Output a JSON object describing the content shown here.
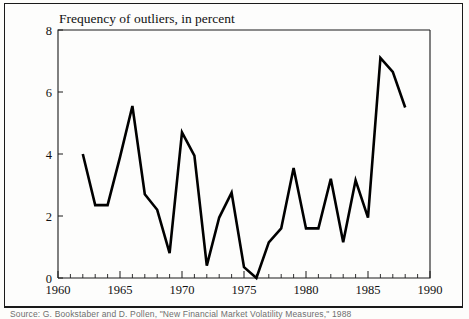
{
  "figure": {
    "title": "Frequency of outliers, in percent",
    "caption": "Source: G. Bookstaber and D. Pollen, \"New Financial Market Volatility Measures,\" 1988"
  },
  "chart_data": {
    "type": "line",
    "title": "Frequency of outliers, in percent",
    "xlabel": "",
    "ylabel": "Frequency of outliers, in percent",
    "xlim": [
      1960,
      1990
    ],
    "ylim": [
      0,
      8
    ],
    "yticks": [
      0,
      2,
      4,
      6,
      8
    ],
    "ytick_labels": [
      "0",
      "2",
      "4",
      "6",
      "8"
    ],
    "xticks": [
      1960,
      1965,
      1970,
      1975,
      1980,
      1985,
      1990
    ],
    "xtick_labels": [
      "1960",
      "1965",
      "1970",
      "1975",
      "1980",
      "1985",
      "1990"
    ],
    "minor_xtick_step": 1,
    "grid": false,
    "legend": false,
    "line_color": "#000000",
    "series": [
      {
        "name": "Frequency of outliers",
        "x": [
          1962,
          1963,
          1964,
          1965,
          1966,
          1967,
          1968,
          1969,
          1970,
          1971,
          1972,
          1973,
          1974,
          1975,
          1976,
          1977,
          1978,
          1979,
          1980,
          1981,
          1982,
          1983,
          1984,
          1985,
          1986,
          1987,
          1988
        ],
        "values": [
          4.0,
          2.35,
          2.35,
          3.9,
          5.55,
          2.7,
          2.2,
          0.8,
          4.7,
          3.95,
          0.4,
          1.95,
          2.75,
          0.35,
          0.0,
          1.15,
          1.6,
          3.55,
          1.6,
          1.6,
          3.2,
          1.15,
          3.15,
          1.95,
          7.1,
          6.65,
          5.5
        ]
      }
    ]
  },
  "axes_geometry": {
    "left_px": 58,
    "right_px": 430,
    "top_px": 30,
    "bottom_px": 278
  }
}
